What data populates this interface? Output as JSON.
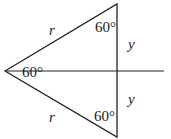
{
  "diagram": {
    "type": "geometry",
    "stroke_color": "#222222",
    "background": "#ffffff",
    "shapes": {
      "triangle": {
        "vertices": [
          [
            5,
            71
          ],
          [
            117,
            4
          ],
          [
            117,
            137
          ]
        ]
      },
      "axis_line": {
        "from": [
          5,
          71
        ],
        "to": [
          164,
          71
        ]
      }
    },
    "labels": {
      "side_top": "r",
      "side_bottom": "r",
      "angle_top": "60°",
      "angle_bottom": "60°",
      "angle_left": "60°",
      "segment_upper": "y",
      "segment_lower": "y"
    }
  }
}
